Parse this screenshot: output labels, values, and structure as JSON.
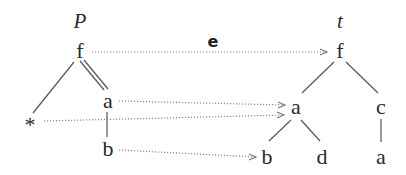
{
  "pattern": {
    "label": "P",
    "nodes": {
      "root": "f",
      "a": "a",
      "star": "*",
      "b": "b"
    }
  },
  "tree": {
    "label": "t",
    "nodes": {
      "root": "f",
      "a": "a",
      "c": "c",
      "b": "b",
      "d": "d",
      "ca": "a"
    }
  },
  "mapping_label": "e"
}
